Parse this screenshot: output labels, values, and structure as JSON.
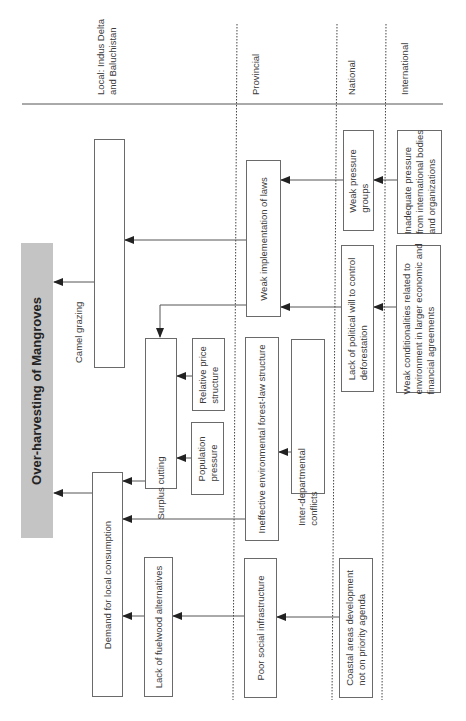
{
  "title": "Over-harvesting of Mangroves",
  "levels": [
    {
      "id": "local",
      "label": "Local: Indus Delta\nand Baluchistan"
    },
    {
      "id": "provincial",
      "label": "Provincial"
    },
    {
      "id": "national",
      "label": "National"
    },
    {
      "id": "international",
      "label": "International"
    }
  ],
  "nodes": {
    "main": "Over-harvesting of Mangroves",
    "camel_grazing": "Camel grazing",
    "demand_local": "Demand for local consumption",
    "surplus_cutting": "Surplus cutting",
    "relative_price": "Relative price\nstructure",
    "population_pressure": "Population\npressure",
    "lack_fuelwood": "Lack of fuelwood alternatives",
    "weak_implementation": "Weak implementation of laws",
    "ineffective_forest_law": "Ineffective environmental forest-law structure",
    "inter_departmental": "Inter-departmental\nconflicts",
    "poor_social": "Poor social infrastructure",
    "weak_pressure_groups": "Weak pressure\ngroups",
    "lack_political_will": "Lack of political will to control\ndeforestation",
    "coastal_areas": "Coastal areas development\nnot on priority agenda",
    "inadequate_pressure": "Inadequate pressure\nfrom international bodies\nand organizations",
    "weak_conditionalities": "Weak conditionalities related to\nenvironment in larger economic and\nfinancial agreements"
  },
  "edges": [
    {
      "from": "camel_grazing",
      "to": "main"
    },
    {
      "from": "demand_local",
      "to": "main"
    },
    {
      "from": "weak_implementation",
      "to": "camel_grazing"
    },
    {
      "from": "weak_implementation",
      "to": "surplus_cutting"
    },
    {
      "from": "surplus_cutting",
      "to": "demand_local"
    },
    {
      "from": "relative_price",
      "to": "surplus_cutting"
    },
    {
      "from": "population_pressure",
      "to": "surplus_cutting"
    },
    {
      "from": "ineffective_forest_law",
      "to": "demand_local"
    },
    {
      "from": "inter_departmental",
      "to": "ineffective_forest_law"
    },
    {
      "from": "lack_fuelwood",
      "to": "demand_local"
    },
    {
      "from": "poor_social",
      "to": "lack_fuelwood"
    },
    {
      "from": "coastal_areas",
      "to": "poor_social"
    },
    {
      "from": "weak_pressure_groups",
      "to": "weak_implementation"
    },
    {
      "from": "lack_political_will",
      "to": "weak_implementation"
    },
    {
      "from": "inadequate_pressure",
      "to": "weak_pressure_groups"
    },
    {
      "from": "weak_conditionalities",
      "to": "lack_political_will"
    }
  ],
  "colors": {
    "main_fill": "#c4c4c4",
    "line": "#555555",
    "box_border": "#6a6a6a"
  }
}
